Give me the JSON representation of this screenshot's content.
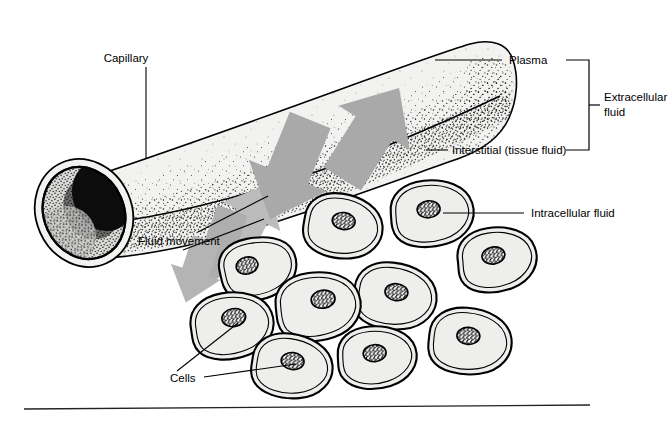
{
  "figure": {
    "background_color": "#ffffff",
    "width": 670,
    "height": 424
  },
  "labels": {
    "capillary": "Capillary",
    "plasma": "Plasma",
    "interstitial": "Interstitial (tissue fluid)",
    "extracellular_line1": "Extracellular",
    "extracellular_line2": "fluid",
    "intracellular": "Intracellular fluid",
    "fluid_movement": "Fluid movement",
    "cells": "Cells"
  },
  "caption": {
    "text": ""
  },
  "colors": {
    "outline": "#000000",
    "tube_fill": "#efefed",
    "tube_fill_light": "#f4f4f2",
    "lumen_dark": "#0a0a0a",
    "arrow_gray": "#a8a8a8",
    "arrow_gray_light": "#bdbdbd",
    "cell_fill": "#eeeeec",
    "nucleus_dark": "#141414",
    "stipple": "#1a1a1a",
    "rule": "#222222",
    "text": "#000000"
  },
  "elements": {
    "arrow_count_inward": 2,
    "arrow_count_outward": 3,
    "cell_count": 10
  },
  "cells": [
    {
      "id": "cell-1",
      "cx": 258,
      "cy": 268,
      "rx": 38,
      "ry": 30,
      "rot": -14,
      "nx": 248,
      "ny": 263
    },
    {
      "id": "cell-2",
      "cx": 343,
      "cy": 226,
      "rx": 39,
      "ry": 32,
      "rot": 8,
      "nx": 343,
      "ny": 221
    },
    {
      "id": "cell-3",
      "cx": 432,
      "cy": 213,
      "rx": 41,
      "ry": 33,
      "rot": -6,
      "nx": 429,
      "ny": 210
    },
    {
      "id": "cell-4",
      "cx": 395,
      "cy": 296,
      "rx": 41,
      "ry": 33,
      "rot": 6,
      "nx": 396,
      "ny": 292
    },
    {
      "id": "cell-5",
      "cx": 318,
      "cy": 306,
      "rx": 42,
      "ry": 34,
      "rot": -8,
      "nx": 324,
      "ny": 300
    },
    {
      "id": "cell-6",
      "cx": 232,
      "cy": 325,
      "rx": 41,
      "ry": 33,
      "rot": -10,
      "nx": 235,
      "ny": 318
    },
    {
      "id": "cell-7",
      "cx": 292,
      "cy": 366,
      "rx": 40,
      "ry": 32,
      "rot": 7,
      "nx": 292,
      "ny": 361
    },
    {
      "id": "cell-8",
      "cx": 377,
      "cy": 357,
      "rx": 39,
      "ry": 31,
      "rot": -5,
      "nx": 375,
      "ny": 353
    },
    {
      "id": "cell-9",
      "cx": 470,
      "cy": 341,
      "rx": 41,
      "ry": 33,
      "rot": 4,
      "nx": 468,
      "ny": 336
    },
    {
      "id": "cell-10",
      "cx": 497,
      "cy": 259,
      "rx": 39,
      "ry": 32,
      "rot": -9,
      "nx": 494,
      "ny": 255
    }
  ]
}
